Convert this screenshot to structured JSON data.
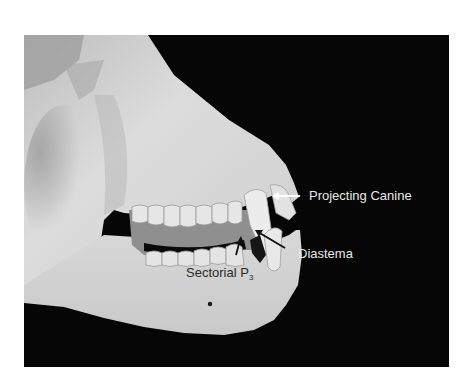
{
  "figure": {
    "background_color": "#060606",
    "bone_color": "#d9d9d9",
    "annotations": [
      {
        "id": "projecting-canine",
        "text": "Projecting Canine",
        "arrow_color": "#ffffff"
      },
      {
        "id": "diastema",
        "text": "Diastema",
        "arrow_color": "#000000"
      },
      {
        "id": "sectorial-p3",
        "text": "Sectorial P",
        "subscript": "3",
        "arrow_color": "#000000"
      }
    ]
  }
}
